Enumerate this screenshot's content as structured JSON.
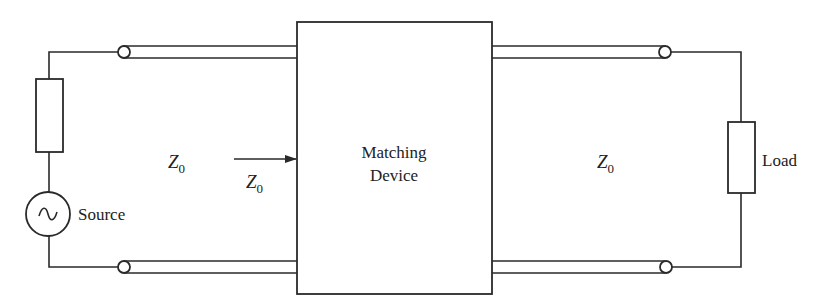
{
  "diagram": {
    "source": {
      "label": "Source",
      "symbol": "~"
    },
    "load": {
      "label": "Load"
    },
    "matching_device": {
      "line1": "Matching",
      "line2": "Device"
    },
    "line_left": {
      "impedance": "Z",
      "subscript": "0"
    },
    "input_arrow": {
      "impedance": "Z",
      "subscript": "0"
    },
    "line_right": {
      "impedance": "Z",
      "subscript": "0"
    },
    "colors": {
      "stroke": "#2a2a2a",
      "text": "#222222",
      "background": "#ffffff"
    }
  }
}
